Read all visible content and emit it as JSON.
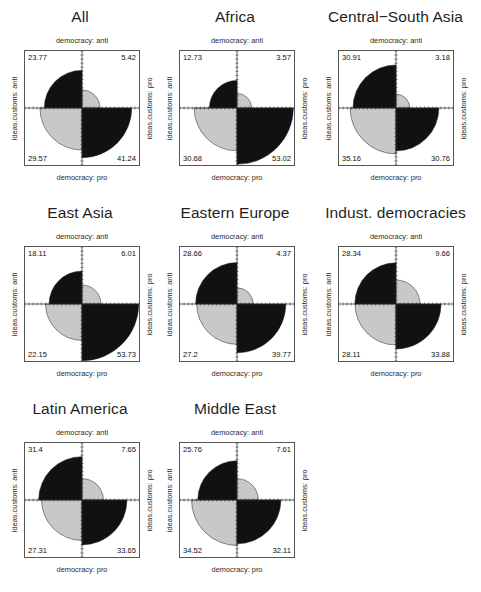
{
  "figure": {
    "type": "fourfold-display-grid",
    "rows": 3,
    "cols": 3,
    "colors": {
      "high": "#111111",
      "low": "#c8c8c8",
      "background": "#ffffff",
      "border": "#555555"
    }
  },
  "axis_labels": {
    "top": "democracy: anti",
    "bottom": "democracy: pro",
    "left": "ideas.customs: anti",
    "right": "ideas.customs: pro"
  },
  "chart_data": {
    "type": "pie",
    "title": "",
    "xlabel": "democracy: anti / democracy: pro",
    "ylabel": "ideas.customs: anti / ideas.customs: pro",
    "cell_order": [
      "top_left",
      "top_right",
      "bottom_left",
      "bottom_right"
    ],
    "cell_meaning": {
      "top_left": "ideas.customs: anti & democracy: anti",
      "top_right": "ideas.customs: pro & democracy: anti",
      "bottom_left": "ideas.customs: anti & democracy: pro",
      "bottom_right": "ideas.customs: pro & democracy: pro"
    },
    "panels": [
      {
        "name": "All",
        "top_left": 23.77,
        "top_right": 5.42,
        "bottom_left": 29.57,
        "bottom_right": 41.24
      },
      {
        "name": "Africa",
        "top_left": 12.73,
        "top_right": 3.57,
        "bottom_left": 30.68,
        "bottom_right": 53.02
      },
      {
        "name": "Central−South Asia",
        "top_left": 30.91,
        "top_right": 3.18,
        "bottom_left": 35.16,
        "bottom_right": 30.76
      },
      {
        "name": "East Asia",
        "top_left": 18.11,
        "top_right": 6.01,
        "bottom_left": 22.15,
        "bottom_right": 53.73
      },
      {
        "name": "Eastern Europe",
        "top_left": 28.66,
        "top_right": 4.37,
        "bottom_left": 27.2,
        "bottom_right": 39.77
      },
      {
        "name": "Indust. democracies",
        "top_left": 28.34,
        "top_right": 9.66,
        "bottom_left": 28.11,
        "bottom_right": 33.88
      },
      {
        "name": "Latin America",
        "top_left": 31.4,
        "top_right": 7.65,
        "bottom_left": 27.31,
        "bottom_right": 33.65
      },
      {
        "name": "Middle East",
        "top_left": 25.76,
        "top_right": 7.61,
        "bottom_left": 34.52,
        "bottom_right": 32.11
      }
    ],
    "value_labels": [
      {
        "top_left": "23.77",
        "top_right": "5.42",
        "bottom_left": "29.57",
        "bottom_right": "41.24"
      },
      {
        "top_left": "12.73",
        "top_right": "3.57",
        "bottom_left": "30.68",
        "bottom_right": "53.02"
      },
      {
        "top_left": "30.91",
        "top_right": "3.18",
        "bottom_left": "35.16",
        "bottom_right": "30.76"
      },
      {
        "top_left": "18.11",
        "top_right": "6.01",
        "bottom_left": "22.15",
        "bottom_right": "53.73"
      },
      {
        "top_left": "28.66",
        "top_right": "4.37",
        "bottom_left": "27.2",
        "bottom_right": "39.77"
      },
      {
        "top_left": "28.34",
        "top_right": "9.66",
        "bottom_left": "28.11",
        "bottom_right": "33.88"
      },
      {
        "top_left": "31.4",
        "top_right": "7.65",
        "bottom_left": "27.31",
        "bottom_right": "33.65"
      },
      {
        "top_left": "25.76",
        "top_right": "7.61",
        "bottom_left": "34.52",
        "bottom_right": "32.11"
      }
    ]
  }
}
